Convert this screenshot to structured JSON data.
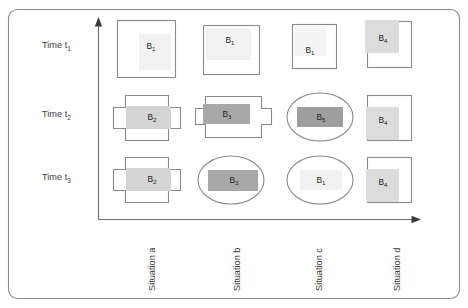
{
  "figure": {
    "frame": {
      "stroke": "#8a8a8a",
      "corner_radius": 9
    },
    "axes": {
      "y_axis_name": "time-axis",
      "x_axis_name": "situation-axis",
      "y_arrow": "up",
      "x_arrow": "right",
      "stroke": "#6f6f6f"
    }
  },
  "rows": [
    {
      "id": "t1",
      "label_main": "Time t",
      "label_sub": "1"
    },
    {
      "id": "t2",
      "label_main": "Time t",
      "label_sub": "2"
    },
    {
      "id": "t3",
      "label_main": "Time t",
      "label_sub": "3"
    }
  ],
  "columns": [
    {
      "id": "a",
      "label": "Situation a"
    },
    {
      "id": "b",
      "label": "Situation b"
    },
    {
      "id": "c",
      "label": "Situation c"
    },
    {
      "id": "d",
      "label": "Situation d"
    }
  ],
  "palette": {
    "very_light_gray": "#f1f1f1",
    "light_gray": "#e8e8e8",
    "mid_light_gray": "#dcdcdc",
    "mid_gray": "#cfcfcf",
    "dark_gray": "#a8a8a8",
    "outline": "#8a8a8a",
    "text": "#2b2b2b"
  },
  "cells": [
    {
      "name": "cell-t1-a",
      "row": "t1",
      "column": "a",
      "container": "square",
      "block_main": "B",
      "block_sub": "1",
      "fill": "#f1f1f1",
      "inner_align": "bottom-right"
    },
    {
      "name": "cell-t1-b",
      "row": "t1",
      "column": "b",
      "container": "square",
      "block_main": "B",
      "block_sub": "1",
      "fill": "#f1f1f1",
      "inner_align": "center-left"
    },
    {
      "name": "cell-t1-c",
      "row": "t1",
      "column": "c",
      "container": "square",
      "block_main": "B",
      "block_sub": "1",
      "fill": "#f4f4f4",
      "inner_align": "top-left"
    },
    {
      "name": "cell-t1-d",
      "row": "t1",
      "column": "d",
      "container": "square",
      "block_main": "B",
      "block_sub": "4",
      "fill": "#dcdcdc",
      "inner_align": "top-left"
    },
    {
      "name": "cell-t2-a",
      "row": "t2",
      "column": "a",
      "container": "cross",
      "block_main": "B",
      "block_sub": "2",
      "fill": "#d4d4d4",
      "inner_align": "center"
    },
    {
      "name": "cell-t2-b",
      "row": "t2",
      "column": "b",
      "container": "cross",
      "block_main": "B",
      "block_sub": "3",
      "fill": "#a8a8a8",
      "inner_align": "center"
    },
    {
      "name": "cell-t2-c",
      "row": "t2",
      "column": "c",
      "container": "ellipse",
      "block_main": "B",
      "block_sub": "5",
      "fill": "#9e9e9e",
      "inner_align": "center"
    },
    {
      "name": "cell-t2-d",
      "row": "t2",
      "column": "d",
      "container": "square",
      "block_main": "B",
      "block_sub": "4",
      "fill": "#dcdcdc",
      "inner_align": "center-left"
    },
    {
      "name": "cell-t3-a",
      "row": "t3",
      "column": "a",
      "container": "cross",
      "block_main": "B",
      "block_sub": "2",
      "fill": "#d4d4d4",
      "inner_align": "center"
    },
    {
      "name": "cell-t3-b",
      "row": "t3",
      "column": "b",
      "container": "ellipse",
      "block_main": "B",
      "block_sub": "3",
      "fill": "#a8a8a8",
      "inner_align": "center"
    },
    {
      "name": "cell-t3-c",
      "row": "t3",
      "column": "c",
      "container": "ellipse",
      "block_main": "B",
      "block_sub": "1",
      "fill": "#f1f1f1",
      "inner_align": "center"
    },
    {
      "name": "cell-t3-d",
      "row": "t3",
      "column": "d",
      "container": "square",
      "block_main": "B",
      "block_sub": "4",
      "fill": "#dcdcdc",
      "inner_align": "center-left"
    }
  ]
}
